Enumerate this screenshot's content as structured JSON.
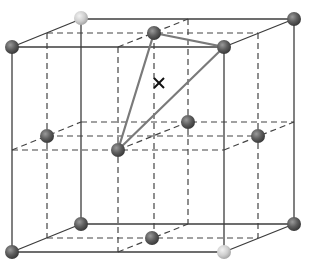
{
  "diagram": {
    "type": "crystal-lattice-unit-cell",
    "colors": {
      "background": "#ffffff",
      "edge_solid": "#3c3c3c",
      "edge_dashed": "#444444",
      "triangle": "#7a7a7a",
      "sphere_dark": "#5e5e5e",
      "sphere_light": "#cfcfcf",
      "marker": "#111111"
    },
    "marker": {
      "symbol": "×",
      "x": 159,
      "y": 83
    },
    "solid_edges": [
      [
        12,
        47,
        224,
        47
      ],
      [
        12,
        47,
        12,
        252
      ],
      [
        224,
        47,
        224,
        252
      ],
      [
        12,
        252,
        224,
        252
      ],
      [
        81,
        19,
        294,
        19
      ],
      [
        81,
        19,
        81,
        224
      ],
      [
        294,
        19,
        294,
        224
      ],
      [
        81,
        224,
        294,
        224
      ],
      [
        12,
        47,
        81,
        19
      ],
      [
        224,
        47,
        294,
        19
      ],
      [
        12,
        252,
        81,
        224
      ],
      [
        224,
        252,
        294,
        224
      ]
    ],
    "dashed_edges": [
      [
        47,
        33,
        258,
        33
      ],
      [
        47,
        33,
        47,
        238
      ],
      [
        258,
        33,
        258,
        238
      ],
      [
        47,
        238,
        258,
        238
      ],
      [
        118,
        47,
        118,
        252
      ],
      [
        188,
        19,
        188,
        224
      ],
      [
        154,
        33,
        154,
        238
      ],
      [
        12,
        150,
        224,
        150
      ],
      [
        81,
        122,
        294,
        122
      ],
      [
        47,
        136,
        258,
        136
      ],
      [
        118,
        47,
        188,
        19
      ],
      [
        118,
        252,
        188,
        224
      ],
      [
        12,
        150,
        81,
        122
      ],
      [
        224,
        150,
        294,
        122
      ],
      [
        118,
        150,
        188,
        122
      ]
    ],
    "triangle": [
      [
        154,
        33
      ],
      [
        224,
        47
      ],
      [
        118,
        150
      ]
    ],
    "spheres": [
      {
        "x": 12,
        "y": 47,
        "tone": "dark"
      },
      {
        "x": 81,
        "y": 18,
        "tone": "light"
      },
      {
        "x": 154,
        "y": 33,
        "tone": "dark"
      },
      {
        "x": 224,
        "y": 47,
        "tone": "dark"
      },
      {
        "x": 294,
        "y": 19,
        "tone": "dark"
      },
      {
        "x": 47,
        "y": 136,
        "tone": "dark"
      },
      {
        "x": 118,
        "y": 150,
        "tone": "dark"
      },
      {
        "x": 188,
        "y": 122,
        "tone": "dark"
      },
      {
        "x": 258,
        "y": 136,
        "tone": "dark"
      },
      {
        "x": 12,
        "y": 252,
        "tone": "dark"
      },
      {
        "x": 81,
        "y": 224,
        "tone": "dark"
      },
      {
        "x": 152,
        "y": 238,
        "tone": "dark"
      },
      {
        "x": 224,
        "y": 252,
        "tone": "light"
      },
      {
        "x": 294,
        "y": 224,
        "tone": "dark"
      }
    ]
  }
}
